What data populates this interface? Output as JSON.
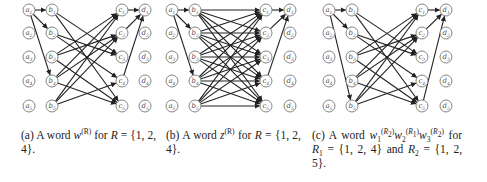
{
  "panels": [
    {
      "id": "a",
      "x_cols": {
        "a": 29,
        "b": 52,
        "c": 122,
        "d": 145
      },
      "rows_y": [
        10,
        33,
        57,
        81,
        106
      ],
      "caption": {
        "label": "(a)",
        "text_before": "A word",
        "word": "w",
        "sup": "(R)",
        "text_after": "for",
        "set_var": "R",
        "set_value": "{1, 2, 4}."
      },
      "edges_ab": [
        [
          1,
          1
        ],
        [
          1,
          2
        ],
        [
          1,
          4
        ]
      ],
      "edges_bc": [
        [
          1,
          3
        ],
        [
          1,
          5
        ],
        [
          2,
          3
        ],
        [
          2,
          4
        ],
        [
          3,
          1
        ],
        [
          3,
          2
        ],
        [
          3,
          5
        ],
        [
          4,
          1
        ],
        [
          4,
          2
        ],
        [
          4,
          5
        ],
        [
          5,
          1
        ],
        [
          5,
          2
        ],
        [
          5,
          4
        ]
      ],
      "edges_cd": [
        [
          1,
          1
        ],
        [
          2,
          1
        ],
        [
          4,
          1
        ]
      ]
    },
    {
      "id": "b",
      "x_cols": {
        "a": 172,
        "b": 195,
        "c": 266,
        "d": 290
      },
      "rows_y": [
        10,
        33,
        57,
        81,
        106
      ],
      "caption": {
        "label": "(b)",
        "text_before": "A word",
        "word": "z",
        "sup": "(R)",
        "text_after": "for",
        "set_var": "R",
        "set_value": "{1, 2, 4}."
      },
      "edges_ab": [
        [
          1,
          1
        ],
        [
          1,
          2
        ],
        [
          1,
          4
        ]
      ],
      "edges_bc": "complete",
      "edges_cd": [
        [
          1,
          1
        ],
        [
          2,
          1
        ],
        [
          4,
          1
        ]
      ]
    },
    {
      "id": "c",
      "x_cols": {
        "a": 329,
        "b": 352,
        "c": 422,
        "d": 446
      },
      "rows_y": [
        10,
        33,
        57,
        81,
        106
      ],
      "caption": {
        "label": "(c)",
        "text_before": "A word",
        "line2": "for",
        "r1": "R",
        "r1_sub": "1",
        "r1_value": "= {1, 2, 4}",
        "and": "and",
        "r2": "R",
        "r2_sub": "2",
        "r2_value": "= {1, 2, 5}."
      },
      "edges_ab": [
        [
          1,
          1
        ],
        [
          1,
          2
        ],
        [
          1,
          5
        ]
      ],
      "edges_bc": [
        [
          1,
          3
        ],
        [
          1,
          5
        ],
        [
          2,
          3
        ],
        [
          2,
          4
        ],
        [
          3,
          1
        ],
        [
          3,
          2
        ],
        [
          3,
          5
        ],
        [
          4,
          1
        ],
        [
          4,
          2
        ],
        [
          4,
          5
        ],
        [
          5,
          1
        ],
        [
          5,
          2
        ],
        [
          5,
          4
        ]
      ],
      "edges_cd": [
        [
          1,
          1
        ],
        [
          2,
          1
        ],
        [
          5,
          1
        ]
      ]
    }
  ],
  "node_labels": {
    "a": [
      "a1",
      "a2",
      "a3",
      "a4",
      "a5"
    ],
    "b": [
      "b1",
      "b2",
      "b3",
      "b4",
      "b5"
    ],
    "c": [
      "c1",
      "c2",
      "c3",
      "c4",
      "c5"
    ],
    "d": [
      "d1",
      "d2",
      "d3",
      "d4",
      "d5"
    ]
  }
}
